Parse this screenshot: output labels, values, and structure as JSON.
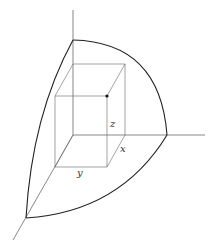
{
  "figure": {
    "labels": {
      "z": "z",
      "x": "x",
      "y": "y"
    },
    "colors": {
      "background": "#ffffff",
      "sphere_stroke": "#222222",
      "axis_stroke": "#555555",
      "box_stroke": "#666666",
      "vertex_dot": "#111111"
    }
  }
}
